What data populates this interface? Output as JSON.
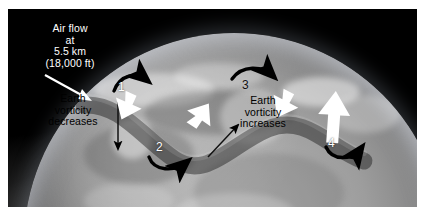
{
  "figure": {
    "kind": "annotated-satellite-diagram",
    "background_color": "#000000",
    "border_color": "#ffffff"
  },
  "callouts": {
    "altitude_caption": "Air flow\nat\n5.5 km\n(18,000 ft)",
    "vorticity_decreases": "Earth\nvorticity\ndecreases",
    "vorticity_increases": "Earth\nvorticity\nincreases"
  },
  "wave_numbers": [
    {
      "id": "1",
      "label": "1"
    },
    {
      "id": "2",
      "label": "2"
    },
    {
      "id": "3",
      "label": "3"
    },
    {
      "id": "4",
      "label": "4"
    }
  ],
  "arrows": {
    "pointer_to_globe": "white-straight-arrow",
    "flow_1": "white-arrow-down-right",
    "flow_2": "white-arrow-up-right",
    "flow_3": "white-arrow-down-right",
    "flow_4": "white-arrow-up",
    "curve_1": "black-curved-arrow-clockwise",
    "curve_2": "black-curved-arrow-counterclockwise",
    "curve_3": "black-curved-arrow-clockwise",
    "curve_4": "black-curved-arrow-counterclockwise",
    "vorticity_down": "black-straight-arrow-down",
    "vorticity_up": "black-straight-arrow-up-right"
  },
  "colors": {
    "caption_text": "#ffffff",
    "label_text": "#000000",
    "flow_arrow": "#ffffff",
    "spin_arrow": "#000000",
    "globe_light": "#b9b9b9",
    "globe_dark": "#2a2a2a"
  }
}
